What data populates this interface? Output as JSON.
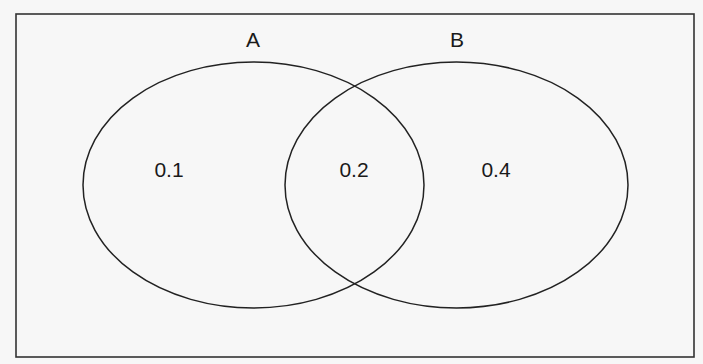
{
  "diagram": {
    "type": "venn",
    "sets": [
      {
        "label": "A",
        "only_value": "0.1"
      },
      {
        "label": "B",
        "only_value": "0.4"
      }
    ],
    "intersection_value": "0.2",
    "colors": {
      "stroke": "#222222",
      "background": "#f7f7f7"
    }
  }
}
